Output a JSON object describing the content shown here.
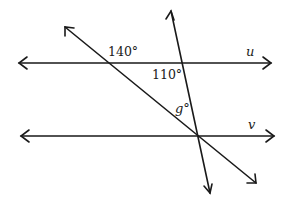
{
  "diagram": {
    "type": "parallel-lines-with-transversals",
    "lines": {
      "u": {
        "label": "u"
      },
      "v": {
        "label": "v"
      }
    },
    "angles": {
      "angle_1": "140°",
      "angle_2": "110°",
      "angle_g": "g°"
    },
    "colors": {
      "stroke": "#1a1a1a",
      "background": "#ffffff"
    }
  }
}
